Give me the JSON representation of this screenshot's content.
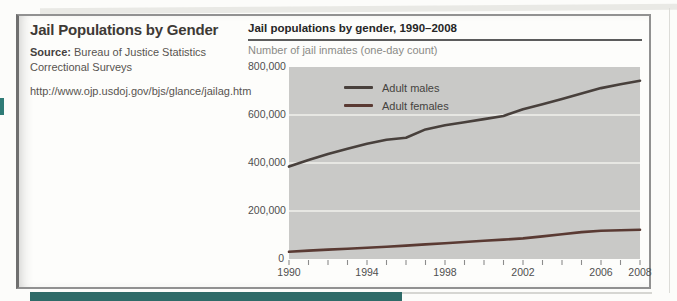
{
  "left_panel": {
    "title": "Jail Populations by Gender",
    "source_label": "Source:",
    "source_text": " Bureau of Justice Statistics Correctional Surveys",
    "url": "http://www.ojp.usdoj.gov/bjs/glance/jailag.htm"
  },
  "decor": {
    "tab_color": "#2f7b76",
    "bottom_bar_color": "#2f6b68"
  },
  "chart_data": {
    "type": "line",
    "title": "Jail populations by gender, 1990–2008",
    "subtitle": "Number of jail inmates (one-day count)",
    "xlabel": "",
    "ylabel": "Number of jail inmates (one-day count)",
    "x": [
      1990,
      1991,
      1992,
      1993,
      1994,
      1995,
      1996,
      1997,
      1998,
      1999,
      2000,
      2001,
      2002,
      2003,
      2004,
      2005,
      2006,
      2007,
      2008
    ],
    "series": [
      {
        "name": "Adult males",
        "color": "#48403c",
        "values": [
          385000,
          412000,
          437000,
          459000,
          480000,
          497000,
          505000,
          540000,
          557000,
          570000,
          583000,
          596000,
          624000,
          645000,
          667000,
          689000,
          712000,
          728000,
          743000
        ]
      },
      {
        "name": "Adult females",
        "color": "#5a3a33",
        "values": [
          30000,
          35000,
          39000,
          43000,
          47000,
          51000,
          56000,
          61000,
          66000,
          71000,
          76000,
          81000,
          86000,
          94000,
          103000,
          112000,
          118000,
          120000,
          122000
        ]
      }
    ],
    "ylim": [
      0,
      800000
    ],
    "gridline_values": [
      200000,
      400000,
      600000
    ],
    "ytick_labels": [
      "800,000",
      "600,000",
      "400,000",
      "200,000",
      "0"
    ],
    "xtick_labels": [
      "1990",
      "1994",
      "1998",
      "2002",
      "2006",
      "2008"
    ],
    "xtick_years": [
      1990,
      1994,
      1998,
      2002,
      2006,
      2008
    ],
    "grid": true,
    "legend_position": "top-left",
    "plot_bg": "#c9c9c7",
    "grid_color": "#f1f0ec",
    "tick_color": "#8c8c8c"
  }
}
